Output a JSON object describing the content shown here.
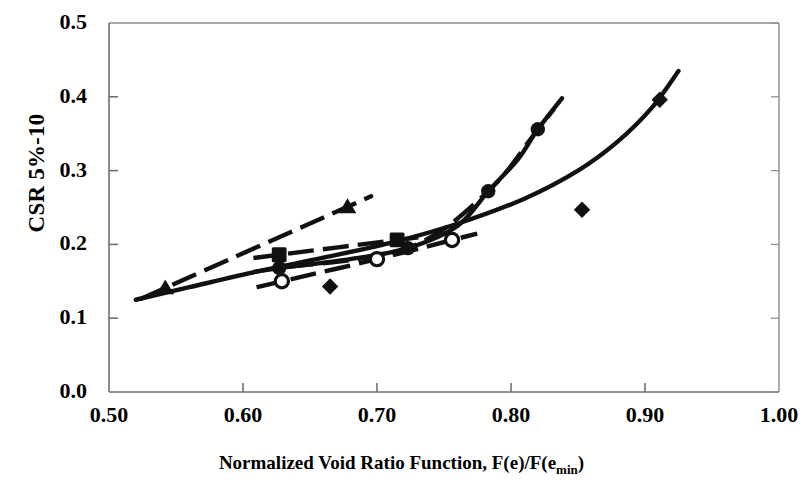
{
  "chart_data": {
    "type": "scatter",
    "title": "",
    "xlabel": "Normalized Void Ratio Function, F(e)/F(emin)",
    "xlabel_main": "Normalized Void Ratio Function, F(e)/F(e",
    "xlabel_sub": "min",
    "xlabel_tail": ")",
    "ylabel": "CSR 5%-10",
    "xlim": [
      0.5,
      1.0
    ],
    "ylim": [
      0.0,
      0.5
    ],
    "xticks": [
      "0.50",
      "0.60",
      "0.70",
      "0.80",
      "0.90",
      "1.00"
    ],
    "xtick_values": [
      0.5,
      0.6,
      0.7,
      0.8,
      0.9,
      1.0
    ],
    "yticks": [
      "0.0",
      "0.1",
      "0.2",
      "0.3",
      "0.4",
      "0.5"
    ],
    "ytick_values": [
      0.0,
      0.1,
      0.2,
      0.3,
      0.4,
      0.5
    ],
    "grid": false,
    "legend": "none",
    "frame_color": "#8a8a8a",
    "series_color": "#111111",
    "series": [
      {
        "name": "triangle-series",
        "marker": "triangle-filled",
        "line": "dashed",
        "x": [
          0.542,
          0.678
        ],
        "y": [
          0.141,
          0.251
        ]
      },
      {
        "name": "square-series",
        "marker": "square-filled",
        "line": "dashed",
        "x": [
          0.627,
          0.715
        ],
        "y": [
          0.186,
          0.206
        ]
      },
      {
        "name": "filled-circle-series",
        "marker": "circle-filled",
        "line": "dashed",
        "x": [
          0.627,
          0.723,
          0.783,
          0.82
        ],
        "y": [
          0.168,
          0.195,
          0.272,
          0.356
        ]
      },
      {
        "name": "open-circle-series",
        "marker": "circle-open",
        "line": "dashed",
        "x": [
          0.629,
          0.7,
          0.756
        ],
        "y": [
          0.15,
          0.18,
          0.206
        ]
      },
      {
        "name": "diamond-series",
        "marker": "diamond-filled",
        "line": "solid-curve",
        "x": [
          0.665,
          0.853,
          0.911
        ],
        "y": [
          0.143,
          0.247,
          0.396
        ]
      }
    ],
    "curves": [
      {
        "name": "upper-solid-curve",
        "note": "thick solid curve rising from (0.52,0.125) through (0.68,0.19) to (0.93,0.435)",
        "style": "solid",
        "points": [
          [
            0.52,
            0.125
          ],
          [
            0.56,
            0.142
          ],
          [
            0.61,
            0.163
          ],
          [
            0.66,
            0.182
          ],
          [
            0.71,
            0.202
          ],
          [
            0.76,
            0.228
          ],
          [
            0.81,
            0.262
          ],
          [
            0.85,
            0.3
          ],
          [
            0.88,
            0.34
          ],
          [
            0.905,
            0.385
          ],
          [
            0.925,
            0.435
          ]
        ]
      },
      {
        "name": "filled-circle-curve",
        "note": "steep dashed/solid curve through filled circle points ending near (0.84,0.39)",
        "style": "solid",
        "points": [
          [
            0.627,
            0.168
          ],
          [
            0.68,
            0.18
          ],
          [
            0.723,
            0.195
          ],
          [
            0.76,
            0.225
          ],
          [
            0.783,
            0.272
          ],
          [
            0.805,
            0.315
          ],
          [
            0.82,
            0.356
          ],
          [
            0.838,
            0.398
          ]
        ]
      }
    ]
  },
  "axes": {
    "left_px": 109,
    "right_px": 779,
    "top_px": 23,
    "bottom_px": 392
  }
}
